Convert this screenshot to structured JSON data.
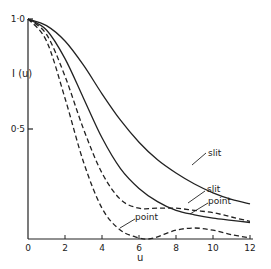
{
  "chart_data": {
    "type": "line",
    "title": "",
    "xlabel": "u",
    "ylabel": "I (u)",
    "xlim": [
      0,
      12
    ],
    "ylim": [
      0,
      1.0
    ],
    "x_ticks": [
      "0",
      "2",
      "4",
      "6",
      "8",
      "10",
      "12"
    ],
    "y_ticks": [
      "0·5",
      "1·0"
    ],
    "grid": false,
    "legend": "none (curves labelled inline)",
    "series": [
      {
        "name": "slit (solid, upper)",
        "style": "solid",
        "x": [
          0,
          1,
          2,
          3,
          4,
          5,
          6,
          7,
          8,
          9,
          10,
          11,
          12
        ],
        "values": [
          1.0,
          0.97,
          0.9,
          0.79,
          0.66,
          0.54,
          0.44,
          0.36,
          0.3,
          0.25,
          0.21,
          0.18,
          0.16
        ]
      },
      {
        "name": "point (solid, lower)",
        "style": "solid",
        "x": [
          0,
          1,
          2,
          3,
          4,
          5,
          6,
          7,
          8,
          9,
          10,
          11,
          12
        ],
        "values": [
          1.0,
          0.95,
          0.82,
          0.64,
          0.46,
          0.32,
          0.23,
          0.17,
          0.13,
          0.11,
          0.095,
          0.085,
          0.075
        ]
      },
      {
        "name": "slit (dashed, upper)",
        "style": "dashed",
        "x": [
          0,
          1,
          2,
          3,
          4,
          5,
          6,
          7,
          8,
          9,
          10,
          11,
          12
        ],
        "values": [
          1.0,
          0.93,
          0.74,
          0.5,
          0.3,
          0.18,
          0.14,
          0.14,
          0.14,
          0.13,
          0.12,
          0.1,
          0.08
        ]
      },
      {
        "name": "point (dashed, lower)",
        "style": "dashed",
        "x": [
          0,
          1,
          2,
          3,
          4,
          5,
          6,
          6.5,
          7,
          8,
          9,
          10,
          11,
          12
        ],
        "values": [
          1.0,
          0.9,
          0.64,
          0.35,
          0.14,
          0.04,
          0.005,
          0.0,
          0.01,
          0.04,
          0.05,
          0.04,
          0.02,
          0.005
        ]
      }
    ],
    "annotations": [
      {
        "text": "slit",
        "points_to": "slit (solid, upper)"
      },
      {
        "text": "slit",
        "points_to": "slit (dashed, upper)"
      },
      {
        "text": "point",
        "points_to": "point (solid, lower)"
      },
      {
        "text": "point",
        "points_to": "point (dashed, lower)"
      }
    ]
  },
  "labels": {
    "ylabel": "I (u)",
    "xlabel": "u",
    "ann_slit_1": "slit",
    "ann_slit_2": "slit",
    "ann_point_1": "point",
    "ann_point_2": "point"
  }
}
